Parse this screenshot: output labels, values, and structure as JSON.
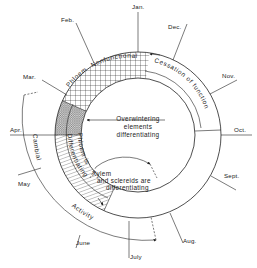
{
  "diagram": {
    "type": "annual-cycle-ring",
    "months": [
      {
        "key": "jan",
        "label": "Jan."
      },
      {
        "key": "feb",
        "label": "Feb."
      },
      {
        "key": "mar",
        "label": "Mar."
      },
      {
        "key": "apr",
        "label": "Apr."
      },
      {
        "key": "may",
        "label": "May"
      },
      {
        "key": "june",
        "label": "June"
      },
      {
        "key": "july",
        "label": "July"
      },
      {
        "key": "aug",
        "label": "Aug."
      },
      {
        "key": "sept",
        "label": "Sept."
      },
      {
        "key": "oct",
        "label": "Oct."
      },
      {
        "key": "nov",
        "label": "Nov."
      },
      {
        "key": "dec",
        "label": "Dec."
      }
    ],
    "ring_labels": {
      "phloem_nonfunctional_1": "Phloem",
      "phloem_nonfunctional_2": "Nonfunctional",
      "cessation": "Cessation of function",
      "phloem_is": "Phloem is",
      "differentiating": "Differentiating",
      "cambial": "Cambial",
      "activity": "Activity"
    },
    "center_text": {
      "line1": "Overwintering",
      "line2": "elements",
      "line3": "differentiating"
    },
    "xylem_text": {
      "line1": "Xylem",
      "line2": "and sclereids are",
      "line3": "differentiating"
    },
    "colors": {
      "ink": "#222222",
      "background": "#ffffff"
    }
  }
}
